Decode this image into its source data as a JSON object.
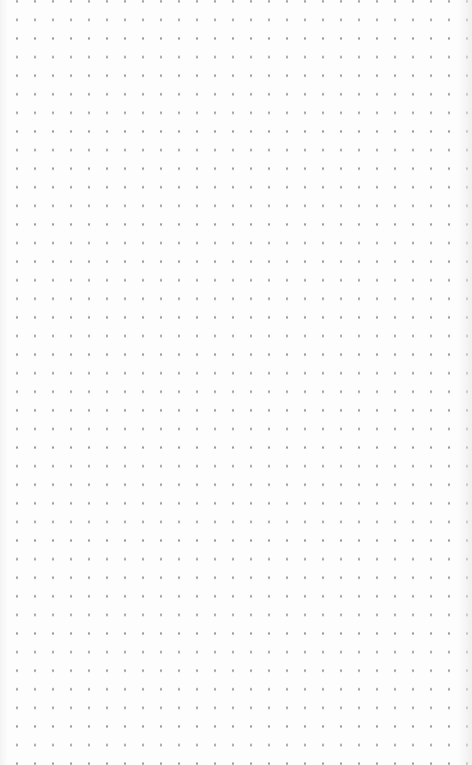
{
  "canvas": {
    "type": "dot-grid",
    "background_color": "#fdfdfd",
    "dot_color": "#9a9a9a",
    "dot_spacing_x": 18,
    "dot_spacing_y": 18.6
  }
}
